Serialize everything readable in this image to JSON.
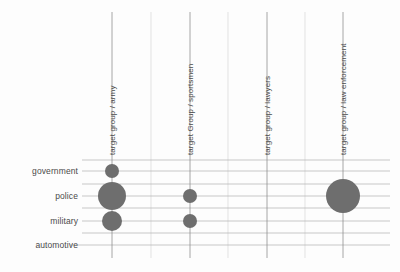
{
  "chart_data": {
    "type": "scatter",
    "title": "",
    "subtitle": "",
    "xlabel": "",
    "ylabel": "",
    "legend": "none",
    "grid": true,
    "categories_x": [
      "target group / army",
      "target Group / sportsmen",
      "target group / lawyers",
      "target group / law enforcement"
    ],
    "categories_y": [
      "government",
      "police",
      "military",
      "automotive"
    ],
    "bubbles": [
      {
        "x": "target group / army",
        "y": "government",
        "size": 7
      },
      {
        "x": "target group / army",
        "y": "police",
        "size": 14
      },
      {
        "x": "target group / army",
        "y": "military",
        "size": 10
      },
      {
        "x": "target Group / sportsmen",
        "y": "police",
        "size": 7
      },
      {
        "x": "target Group / sportsmen",
        "y": "military",
        "size": 7
      },
      {
        "x": "target group / law enforcement",
        "y": "police",
        "size": 17
      }
    ],
    "bubble_color": "#6e6e6e",
    "grid_color": "#b9b9b9",
    "axis_color": "#8f8f8f",
    "text_color": "#4a4a4a"
  },
  "axes": {
    "y_ticks": [
      {
        "label": "government",
        "top": 166
      },
      {
        "label": "police",
        "top": 191
      },
      {
        "label": "military",
        "top": 216
      },
      {
        "label": "automotive",
        "top": 240
      }
    ],
    "x_ticks": [
      {
        "label": "target group / army",
        "left": 108,
        "bottom": 155
      },
      {
        "label": "target Group / sportsmen",
        "left": 186,
        "bottom": 155
      },
      {
        "label": "target group / lawyers",
        "left": 263,
        "bottom": 155
      },
      {
        "label": "target group / law enforcement",
        "left": 339,
        "bottom": 155
      }
    ]
  },
  "geometry": {
    "h_gridlines": [
      160,
      171,
      184,
      196,
      208,
      221,
      233,
      245
    ],
    "v_gridlines_minor": [
      151,
      228,
      305
    ],
    "v_tick_columns": [
      112,
      190,
      267,
      343
    ],
    "plot_left": 82,
    "plot_right": 390,
    "plot_top": 158,
    "plot_bottom": 258,
    "bubble_points": [
      {
        "cx": 112,
        "cy": 171,
        "r": 7
      },
      {
        "cx": 112,
        "cy": 196,
        "r": 14
      },
      {
        "cx": 112,
        "cy": 221,
        "r": 10
      },
      {
        "cx": 190,
        "cy": 196,
        "r": 7
      },
      {
        "cx": 190,
        "cy": 221,
        "r": 7
      },
      {
        "cx": 343,
        "cy": 196,
        "r": 17
      }
    ]
  }
}
